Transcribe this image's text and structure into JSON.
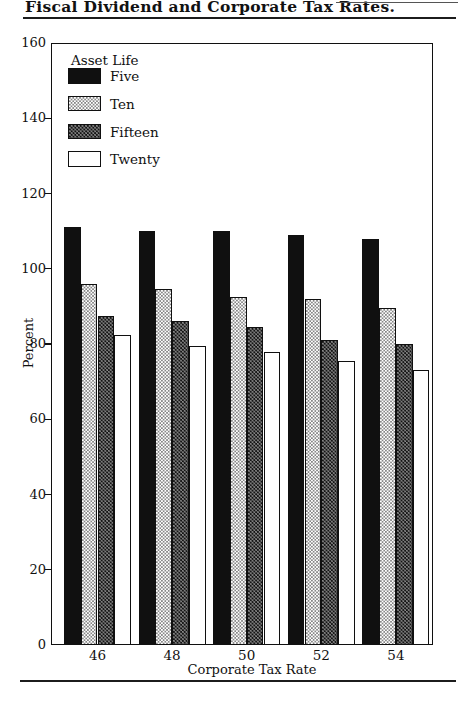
{
  "chart_data": {
    "type": "bar",
    "title": "Fiscal Dividend and Corporate Tax Rates.",
    "xlabel": "Corporate Tax Rate",
    "ylabel": "Percent",
    "legend_title": "Asset Life",
    "legend_position": "top-left-inside",
    "grid": false,
    "categories": [
      "46",
      "48",
      "50",
      "52",
      "54"
    ],
    "series": [
      {
        "name": "Five",
        "pattern": "solid-black",
        "values": [
          111,
          110,
          110,
          109,
          108
        ]
      },
      {
        "name": "Ten",
        "pattern": "light-stipple",
        "values": [
          96,
          94.5,
          92.5,
          92,
          89.5
        ]
      },
      {
        "name": "Fifteen",
        "pattern": "dark-stipple",
        "values": [
          87.5,
          86,
          84.5,
          81,
          80
        ]
      },
      {
        "name": "Twenty",
        "pattern": "white",
        "values": [
          82.5,
          79.5,
          78,
          75.5,
          73
        ]
      }
    ],
    "ylim": [
      0,
      160
    ],
    "ytick_step": 20,
    "yticks": [
      0,
      20,
      40,
      60,
      80,
      100,
      120,
      140,
      160
    ]
  },
  "colors": {
    "ink": "#111111",
    "paper": "#ffffff"
  }
}
